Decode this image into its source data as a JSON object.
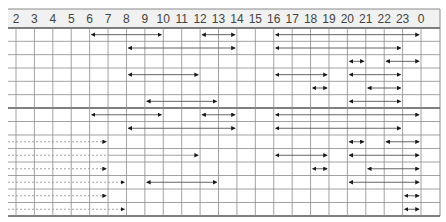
{
  "header": {
    "hours": [
      "2",
      "3",
      "4",
      "5",
      "6",
      "7",
      "8",
      "9",
      "10",
      "11",
      "12",
      "13",
      "14",
      "15",
      "16",
      "17",
      "18",
      "19",
      "20",
      "21",
      "22",
      "23",
      "0"
    ]
  },
  "colors": {
    "header_bg": "#f1f1f1",
    "grid_line": "#8a8a8a",
    "group_separator": "#555555",
    "arrow_line": "#555555",
    "arrowhead": "#1a1a1a",
    "dashed_line": "#999999"
  },
  "groups": [
    {
      "name": "upper-group",
      "rows": [
        {
          "segments": [
            {
              "from": "6",
              "to": "10"
            },
            {
              "from": "12",
              "to": "14"
            },
            {
              "from": "16",
              "to": "0"
            }
          ]
        },
        {
          "segments": [
            {
              "from": "8",
              "to": "14"
            },
            {
              "from": "16",
              "to": "23"
            }
          ]
        },
        {
          "segments": [
            {
              "from": "20",
              "to": "21"
            },
            {
              "from": "22",
              "to": "0"
            }
          ]
        },
        {
          "segments": [
            {
              "from": "8",
              "to": "12"
            },
            {
              "from": "16",
              "to": "19"
            },
            {
              "from": "20",
              "to": "23"
            }
          ]
        },
        {
          "segments": [
            {
              "from": "18",
              "to": "19"
            },
            {
              "from": "21",
              "to": "23"
            }
          ]
        },
        {
          "segments": [
            {
              "from": "9",
              "to": "13"
            },
            {
              "from": "20",
              "to": "23"
            }
          ]
        }
      ]
    },
    {
      "name": "lower-group",
      "rows": [
        {
          "segments": [
            {
              "from": "6",
              "to": "10"
            },
            {
              "from": "12",
              "to": "14"
            },
            {
              "from": "16",
              "to": "0"
            }
          ]
        },
        {
          "segments": [
            {
              "from": "8",
              "to": "14"
            },
            {
              "from": "16",
              "to": "23"
            }
          ]
        },
        {
          "carryover_to": "7",
          "segments": [
            {
              "from": "20",
              "to": "21"
            },
            {
              "from": "22",
              "to": "0"
            }
          ]
        },
        {
          "carryover_to": "7",
          "carryover_solid_to": "12",
          "segments": [
            {
              "from": "16",
              "to": "19"
            },
            {
              "from": "20",
              "to": "0"
            }
          ]
        },
        {
          "carryover_to": "7",
          "segments": [
            {
              "from": "18",
              "to": "19"
            },
            {
              "from": "21",
              "to": "0"
            }
          ]
        },
        {
          "carryover_to": "8",
          "segments": [
            {
              "from": "9",
              "to": "13"
            },
            {
              "from": "20",
              "to": "0"
            }
          ]
        },
        {
          "carryover_to": "7",
          "segments": [
            {
              "from": "23",
              "to": "0"
            }
          ]
        },
        {
          "carryover_to": "8",
          "segments": [
            {
              "from": "23",
              "to": "0"
            }
          ]
        }
      ]
    }
  ]
}
